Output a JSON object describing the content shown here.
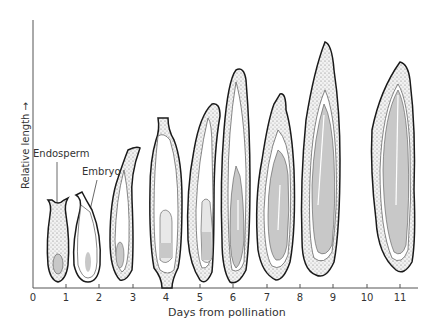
{
  "diagram": {
    "labels": {
      "endosperm": "Endosperm",
      "embryo": "Embryo"
    },
    "x_axis": {
      "label": "Days from pollination",
      "ticks": [
        "0",
        "1",
        "2",
        "3",
        "4",
        "5",
        "6",
        "7",
        "8",
        "9",
        "10",
        "11"
      ]
    },
    "y_axis": {
      "label": "Relative length →"
    },
    "grains": [
      {
        "day": 1,
        "stage": "early",
        "height": 75
      },
      {
        "day": 2,
        "stage": "early",
        "height": 85
      },
      {
        "day": 3,
        "stage": "developing",
        "height": 125
      },
      {
        "day": 4,
        "stage": "developing",
        "height": 135
      },
      {
        "day": 5,
        "stage": "developing",
        "height": 150
      },
      {
        "day": 6,
        "stage": "filling",
        "height": 180
      },
      {
        "day": 7,
        "stage": "filling",
        "height": 160
      },
      {
        "day": 8.5,
        "stage": "filled",
        "height": 230
      },
      {
        "day": 11,
        "stage": "mature",
        "height": 200
      }
    ],
    "colors": {
      "outline": "#1a1a1a",
      "stipple": "#d9d9d9",
      "fill": "#c8c8c8",
      "axis": "#555555"
    }
  }
}
